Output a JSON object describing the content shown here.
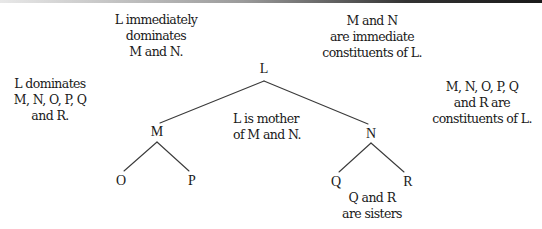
{
  "diagram": {
    "type": "syntax-tree",
    "colors": {
      "line": "#3a3a3a",
      "text": "#1a1a1a",
      "background": "#ffffff"
    },
    "nodes": {
      "L": {
        "label": "L",
        "x": 264,
        "y": 69
      },
      "M": {
        "label": "M",
        "x": 157,
        "y": 132
      },
      "N": {
        "label": "N",
        "x": 371,
        "y": 134
      },
      "O": {
        "label": "O",
        "x": 121,
        "y": 181
      },
      "P": {
        "label": "P",
        "x": 192,
        "y": 181
      },
      "Q": {
        "label": "Q",
        "x": 336,
        "y": 182
      },
      "R": {
        "label": "R",
        "x": 408,
        "y": 182
      }
    },
    "edges": [
      {
        "from": "L",
        "to": "M"
      },
      {
        "from": "L",
        "to": "N"
      },
      {
        "from": "M",
        "to": "O"
      },
      {
        "from": "M",
        "to": "P"
      },
      {
        "from": "N",
        "to": "Q"
      },
      {
        "from": "N",
        "to": "R"
      }
    ],
    "annotations": {
      "dominates": {
        "lines": [
          "L dominates",
          "M, N, O, P, Q",
          "and R."
        ]
      },
      "immediately_dominates": {
        "lines": [
          "L immediately",
          "dominates",
          "M and N."
        ]
      },
      "immediate_constituents": {
        "lines": [
          "M and N",
          "are immediate",
          "constituents of L."
        ]
      },
      "constituents": {
        "lines": [
          "M, N, O, P, Q",
          "and R are",
          "constituents of L."
        ]
      },
      "mother": {
        "lines": [
          "L is mother",
          "of M and N."
        ]
      },
      "sisters": {
        "lines": [
          "Q and R",
          "are sisters"
        ]
      }
    }
  }
}
